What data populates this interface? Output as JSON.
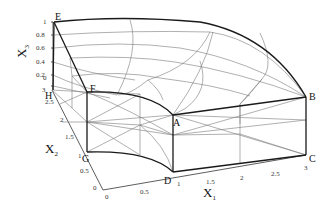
{
  "diagram": {
    "type": "3d-mesh-wireframe",
    "axes": {
      "x1": {
        "label": "X",
        "subscript": "1",
        "ticks": [
          "0",
          "0.5",
          "1",
          "1.5",
          "2",
          "2.5",
          "3"
        ]
      },
      "x2": {
        "label": "X",
        "subscript": "2",
        "ticks": [
          "0",
          "0.5",
          "1",
          "1.5",
          "2",
          "2.5",
          "3"
        ]
      },
      "x3": {
        "label": "X",
        "subscript": "3",
        "ticks": [
          "0",
          "0.2",
          "0.4",
          "0.6",
          "0.8",
          "1"
        ]
      }
    },
    "vertices": {
      "A": "A",
      "B": "B",
      "C": "C",
      "D": "D",
      "E": "E",
      "F": "F",
      "G": "G",
      "H": "H"
    }
  }
}
